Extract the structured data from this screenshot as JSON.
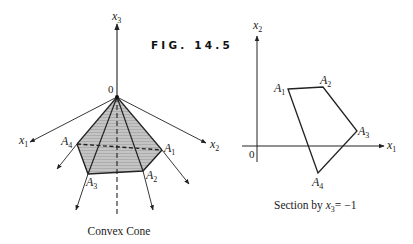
{
  "figure": {
    "title": "FIG. 14.5",
    "left_panel": {
      "caption": "Convex Cone",
      "origin_label": "0",
      "axes": [
        {
          "name": "x",
          "sub": "3"
        },
        {
          "name": "x",
          "sub": "1"
        },
        {
          "name": "x",
          "sub": "2"
        }
      ],
      "vertices": [
        {
          "name": "A",
          "sub": "1"
        },
        {
          "name": "A",
          "sub": "2"
        },
        {
          "name": "A",
          "sub": "3"
        },
        {
          "name": "A",
          "sub": "4"
        }
      ]
    },
    "right_panel": {
      "caption_prefix": "Section by ",
      "caption_var": "x",
      "caption_sub": "3",
      "caption_suffix": "= −1",
      "origin_label": "0",
      "axes": [
        {
          "name": "x",
          "sub": "2"
        },
        {
          "name": "x",
          "sub": "1"
        }
      ],
      "vertices": [
        {
          "name": "A",
          "sub": "1"
        },
        {
          "name": "A",
          "sub": "2"
        },
        {
          "name": "A",
          "sub": "3"
        },
        {
          "name": "A",
          "sub": "4"
        }
      ]
    }
  },
  "colors": {
    "ink": "#222222",
    "fill": "#bdbdbd"
  }
}
